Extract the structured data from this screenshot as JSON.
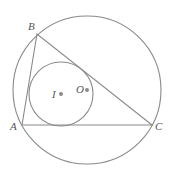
{
  "diagram": {
    "colors": {
      "stroke": "#8a8a8a",
      "label": "#555555",
      "background": "#ffffff"
    },
    "circumcircle": {
      "cx": 87,
      "cy": 90,
      "r": 74
    },
    "incircle": {
      "cx": 61,
      "cy": 94,
      "r": 32
    },
    "vertices": {
      "A": {
        "label": "A",
        "x": 22,
        "y": 125
      },
      "B": {
        "label": "B",
        "x": 37,
        "y": 34
      },
      "C": {
        "label": "C",
        "x": 152,
        "y": 125
      }
    },
    "points": {
      "I": {
        "label": "I",
        "x": 61,
        "y": 94
      },
      "O": {
        "label": "O",
        "x": 87,
        "y": 90
      }
    }
  }
}
